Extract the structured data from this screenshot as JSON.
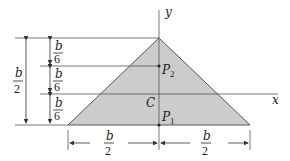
{
  "diagram": {
    "type": "triangle-cross-section",
    "fill_color": "#cccccc",
    "line_color": "#444444",
    "axes": {
      "x_label": "x",
      "y_label": "y"
    },
    "points": {
      "centroid": "C",
      "p1": "P1",
      "p2": "P2"
    },
    "point_labels": {
      "c": "C",
      "p1_main": "P",
      "p1_sub": "1",
      "p2_main": "P",
      "p2_sub": "2"
    },
    "dimensions": {
      "height_total": {
        "num": "b",
        "den": "2"
      },
      "segments": [
        {
          "num": "b",
          "den": "6"
        },
        {
          "num": "b",
          "den": "6"
        },
        {
          "num": "b",
          "den": "6"
        }
      ],
      "base_left": {
        "num": "b",
        "den": "2"
      },
      "base_right": {
        "num": "b",
        "den": "2"
      }
    }
  }
}
